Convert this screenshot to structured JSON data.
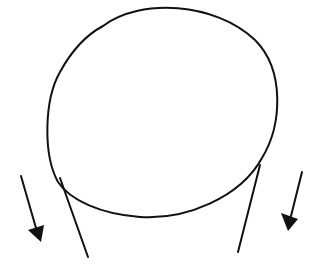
{
  "drawing": {
    "width": 315,
    "height": 277,
    "background": "#ffffff",
    "stroke": "#111111",
    "head": {
      "path": "M 103 26 C 140 -2, 215 2, 255 40 C 285 70, 282 125, 262 158 C 240 198, 185 220, 140 217 C 100 214, 70 200, 58 182 C 43 155, 44 100, 60 72 C 72 50, 88 34, 103 26 Z"
    },
    "neck_left": {
      "x1": 60,
      "y1": 178,
      "x2": 88,
      "y2": 257
    },
    "neck_right": {
      "x1": 260,
      "y1": 165,
      "x2": 238,
      "y2": 252
    },
    "arrows": [
      {
        "name": "left-arrow",
        "x1": 21,
        "y1": 176,
        "x2": 38,
        "y2": 235,
        "head": "28,230 44,225 41,242"
      },
      {
        "name": "right-arrow",
        "x1": 302,
        "y1": 172,
        "x2": 290,
        "y2": 220,
        "head": "281,213 298,219 288,231"
      }
    ]
  }
}
